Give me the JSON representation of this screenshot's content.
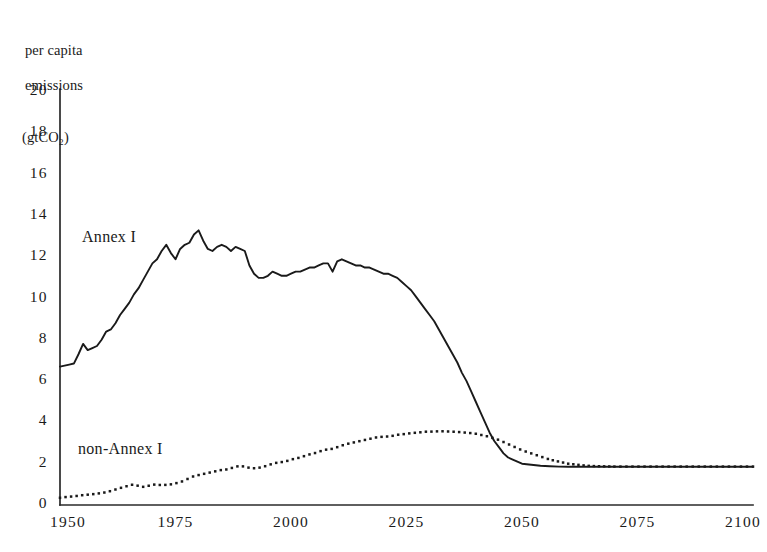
{
  "figure": {
    "y_axis_title_lines": [
      "per capita",
      "emissions",
      "(gtCO₂)"
    ],
    "series_labels": {
      "annex_i": "Annex I",
      "non_annex_i": "non-Annex I"
    }
  },
  "chart_data": {
    "type": "line",
    "title": "",
    "xlabel": "",
    "ylabel": "per capita emissions (gtCO2)",
    "xlim": [
      1950,
      2100
    ],
    "ylim": [
      0,
      20
    ],
    "grid": false,
    "legend": "inline-annotations",
    "xticks": [
      1950,
      1975,
      2000,
      2025,
      2050,
      2075,
      2100
    ],
    "xtick_labels": [
      "1950",
      "1975",
      "2000",
      "2025",
      "2050",
      "2075",
      "2100"
    ],
    "yticks": [
      0,
      2,
      4,
      6,
      8,
      10,
      12,
      14,
      16,
      18,
      20
    ],
    "ytick_labels": [
      "0",
      "2",
      "4",
      "6",
      "8",
      "10",
      "12",
      "14",
      "16",
      "18",
      "20"
    ],
    "series": [
      {
        "name": "Annex I",
        "style": "solid",
        "color": "#1a1a1a",
        "x": [
          1950,
          1951,
          1952,
          1953,
          1954,
          1955,
          1956,
          1957,
          1958,
          1959,
          1960,
          1961,
          1962,
          1963,
          1964,
          1965,
          1966,
          1967,
          1968,
          1969,
          1970,
          1971,
          1972,
          1973,
          1974,
          1975,
          1976,
          1977,
          1978,
          1979,
          1980,
          1981,
          1982,
          1983,
          1984,
          1985,
          1986,
          1987,
          1988,
          1989,
          1990,
          1991,
          1992,
          1993,
          1994,
          1995,
          1996,
          1997,
          1998,
          1999,
          2000,
          2001,
          2002,
          2003,
          2004,
          2005,
          2006,
          2007,
          2008,
          2009,
          2010,
          2011,
          2012,
          2013,
          2014,
          2015,
          2016,
          2017,
          2018,
          2019,
          2020,
          2021,
          2022,
          2023,
          2024,
          2025,
          2026,
          2027,
          2028,
          2029,
          2030,
          2031,
          2032,
          2033,
          2034,
          2035,
          2036,
          2037,
          2038,
          2039,
          2040,
          2041,
          2042,
          2043,
          2044,
          2045,
          2046,
          2047,
          2048,
          2049,
          2050,
          2052,
          2054,
          2056,
          2058,
          2060,
          2062,
          2064,
          2066,
          2070,
          2075,
          2080,
          2085,
          2090,
          2095,
          2100
        ],
        "y": [
          6.7,
          6.75,
          6.8,
          6.85,
          7.3,
          7.8,
          7.5,
          7.6,
          7.7,
          8.0,
          8.4,
          8.5,
          8.8,
          9.2,
          9.5,
          9.8,
          10.2,
          10.5,
          10.9,
          11.3,
          11.7,
          11.9,
          12.3,
          12.6,
          12.2,
          11.9,
          12.4,
          12.6,
          12.7,
          13.1,
          13.3,
          12.8,
          12.4,
          12.3,
          12.5,
          12.6,
          12.5,
          12.3,
          12.5,
          12.4,
          12.3,
          11.6,
          11.2,
          11.0,
          11.0,
          11.1,
          11.3,
          11.2,
          11.1,
          11.1,
          11.2,
          11.3,
          11.3,
          11.4,
          11.5,
          11.5,
          11.6,
          11.7,
          11.7,
          11.3,
          11.8,
          11.9,
          11.8,
          11.7,
          11.6,
          11.6,
          11.5,
          11.5,
          11.4,
          11.3,
          11.2,
          11.2,
          11.1,
          11.0,
          10.8,
          10.6,
          10.4,
          10.1,
          9.8,
          9.5,
          9.2,
          8.9,
          8.5,
          8.1,
          7.7,
          7.3,
          6.9,
          6.4,
          6.0,
          5.5,
          5.0,
          4.5,
          4.0,
          3.5,
          3.1,
          2.8,
          2.5,
          2.3,
          2.2,
          2.1,
          2.0,
          1.95,
          1.9,
          1.88,
          1.86,
          1.85,
          1.85,
          1.85,
          1.85,
          1.85,
          1.85,
          1.85,
          1.85,
          1.85,
          1.85,
          1.85
        ]
      },
      {
        "name": "non-Annex I",
        "style": "dotted",
        "color": "#1a1a1a",
        "x": [
          1950,
          1951,
          1952,
          1953,
          1954,
          1955,
          1956,
          1957,
          1958,
          1959,
          1960,
          1961,
          1962,
          1963,
          1964,
          1965,
          1966,
          1967,
          1968,
          1969,
          1970,
          1971,
          1972,
          1973,
          1974,
          1975,
          1976,
          1977,
          1978,
          1979,
          1980,
          1981,
          1982,
          1983,
          1984,
          1985,
          1986,
          1987,
          1988,
          1989,
          1990,
          1991,
          1992,
          1993,
          1994,
          1995,
          1996,
          1997,
          1998,
          1999,
          2000,
          2001,
          2002,
          2003,
          2004,
          2005,
          2006,
          2007,
          2008,
          2009,
          2010,
          2011,
          2012,
          2013,
          2014,
          2015,
          2016,
          2017,
          2018,
          2019,
          2020,
          2021,
          2022,
          2023,
          2024,
          2025,
          2026,
          2027,
          2028,
          2029,
          2030,
          2031,
          2032,
          2033,
          2034,
          2035,
          2036,
          2037,
          2038,
          2039,
          2040,
          2041,
          2042,
          2043,
          2044,
          2045,
          2046,
          2047,
          2048,
          2049,
          2050,
          2052,
          2054,
          2056,
          2058,
          2060,
          2062,
          2064,
          2066,
          2068,
          2070,
          2075,
          2080,
          2085,
          2090,
          2095,
          2100
        ],
        "y": [
          0.35,
          0.38,
          0.4,
          0.42,
          0.45,
          0.48,
          0.5,
          0.52,
          0.55,
          0.58,
          0.62,
          0.68,
          0.75,
          0.82,
          0.88,
          0.95,
          1.0,
          0.92,
          0.88,
          0.92,
          0.98,
          1.0,
          0.95,
          0.98,
          1.0,
          1.05,
          1.1,
          1.2,
          1.3,
          1.4,
          1.45,
          1.5,
          1.55,
          1.6,
          1.65,
          1.7,
          1.72,
          1.78,
          1.85,
          1.9,
          1.85,
          1.8,
          1.78,
          1.8,
          1.85,
          1.92,
          2.0,
          2.05,
          2.08,
          2.12,
          2.2,
          2.25,
          2.3,
          2.38,
          2.45,
          2.5,
          2.58,
          2.65,
          2.7,
          2.72,
          2.8,
          2.88,
          2.95,
          3.0,
          3.05,
          3.1,
          3.15,
          3.2,
          3.25,
          3.3,
          3.3,
          3.32,
          3.35,
          3.4,
          3.42,
          3.45,
          3.48,
          3.5,
          3.52,
          3.55,
          3.55,
          3.56,
          3.57,
          3.57,
          3.56,
          3.55,
          3.54,
          3.52,
          3.5,
          3.48,
          3.45,
          3.4,
          3.35,
          3.3,
          3.22,
          3.15,
          3.05,
          2.95,
          2.85,
          2.75,
          2.65,
          2.5,
          2.35,
          2.2,
          2.1,
          2.0,
          1.95,
          1.9,
          1.88,
          1.87,
          1.86,
          1.86,
          1.86,
          1.86,
          1.86,
          1.86,
          1.86
        ]
      }
    ],
    "annotations": [
      {
        "text": "Annex I",
        "x": 1957,
        "y": 12.6
      },
      {
        "text": "non-Annex I",
        "x": 1956,
        "y": 2.9
      }
    ],
    "crossover": {
      "x": 2043,
      "y": 3.3
    },
    "convergence_value": 1.86
  }
}
